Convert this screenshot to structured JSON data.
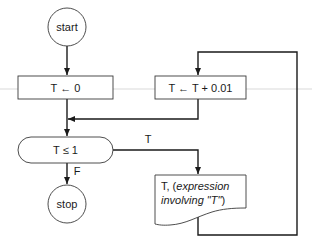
{
  "diagram": {
    "type": "flowchart",
    "nodes": {
      "start": {
        "label": "start",
        "shape": "terminal-circle"
      },
      "init": {
        "label": "T ← 0",
        "shape": "process"
      },
      "increment": {
        "label": "T ← T + 0.01",
        "shape": "process"
      },
      "decision": {
        "label": "T ≤ 1",
        "shape": "decision-pill"
      },
      "output": {
        "shape": "document",
        "line1_plain": "T, (",
        "line1_italic": "expression",
        "line2_italic": "involving \"T\"",
        "line2_plain": ")"
      },
      "stop": {
        "label": "stop",
        "shape": "terminal-circle"
      }
    },
    "edges": {
      "true_label": "T",
      "false_label": "F"
    },
    "colors": {
      "stroke": "#1a1a1a",
      "background": "#ffffff"
    }
  }
}
